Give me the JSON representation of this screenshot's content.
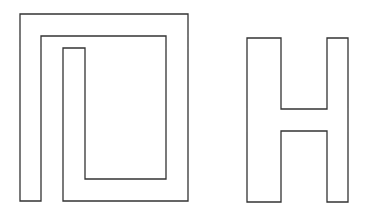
{
  "figure": {
    "background": "#ffffff",
    "stroke_color": "#333333",
    "shapes": [
      {
        "name": "spiral-rectangle",
        "points": "20,14 188,14 188,201 63,201 63,48 85,48 85,179 166,179 166,36 41,36 41,201 20,201"
      },
      {
        "name": "letter-h",
        "points": "247,38 281,38 281,109 327,109 327,38 348,38 348,202 327,202 327,131 281,131 281,202 247,202"
      }
    ]
  }
}
